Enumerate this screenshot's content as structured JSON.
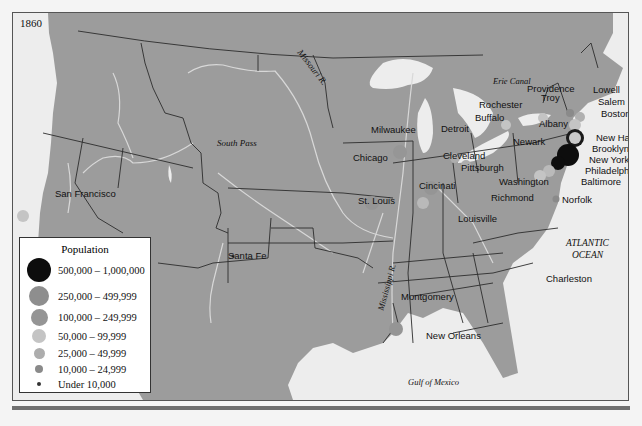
{
  "map": {
    "year": "1860",
    "colors": {
      "land": "#9c9c9c",
      "water": "#ededed",
      "border": "#2d2d2d",
      "river": "#d6d6d6"
    },
    "geo_labels": {
      "missouri_river": "Missouri R.",
      "mississippi_river": "Mississippi R.",
      "south_pass": "South Pass",
      "erie_canal": "Erie Canal",
      "atlantic_line1": "ATLANTIC",
      "atlantic_line2": "OCEAN",
      "gulf": "Gulf of Mexico"
    },
    "cities": [
      {
        "name": "San Francisco",
        "category": "50,000 – 99,999"
      },
      {
        "name": "Santa Fe",
        "category": "Under 10,000"
      },
      {
        "name": "Milwaukee",
        "category": "25,000 – 49,999"
      },
      {
        "name": "Chicago",
        "category": "100,000 – 249,999"
      },
      {
        "name": "Detroit",
        "category": "25,000 – 49,999"
      },
      {
        "name": "St. Louis",
        "category": "100,000 – 249,999"
      },
      {
        "name": "Cleveland",
        "category": "25,000 – 49,999"
      },
      {
        "name": "Cincinati",
        "category": "100,000 – 249,999"
      },
      {
        "name": "Pittsburgh",
        "category": "25,000 – 49,999"
      },
      {
        "name": "Louisville",
        "category": "50,000 – 99,999"
      },
      {
        "name": "Rochester",
        "category": "25,000 – 49,999"
      },
      {
        "name": "Buffalo",
        "category": "50,000 – 99,999"
      },
      {
        "name": "Albany",
        "category": "50,000 – 99,999"
      },
      {
        "name": "Troy",
        "category": "25,000 – 49,999"
      },
      {
        "name": "Providence",
        "category": "50,000 – 99,999"
      },
      {
        "name": "Lowell",
        "category": "25,000 – 49,999"
      },
      {
        "name": "Salem",
        "category": "10,000 – 24,999"
      },
      {
        "name": "Boston",
        "category": "100,000 – 249,999"
      },
      {
        "name": "New Haven",
        "category": "25,000 – 49,999"
      },
      {
        "name": "Brooklyn",
        "category": "250,000 – 499,999"
      },
      {
        "name": "New York",
        "category": "500,000 – 1,000,000"
      },
      {
        "name": "Newark",
        "category": "50,000 – 99,999"
      },
      {
        "name": "Philadelphia",
        "category": "500,000 – 1,000,000"
      },
      {
        "name": "Baltimore",
        "category": "100,000 – 249,999"
      },
      {
        "name": "Washington",
        "category": "50,000 – 99,999"
      },
      {
        "name": "Richmond",
        "category": "25,000 – 49,999"
      },
      {
        "name": "Norfolk",
        "category": "10,000 – 24,999"
      },
      {
        "name": "Charleston",
        "category": "25,000 – 49,999"
      },
      {
        "name": "Montgomery",
        "category": "Under 10,000"
      },
      {
        "name": "New Orleans",
        "category": "100,000 – 249,999"
      }
    ]
  },
  "legend": {
    "title": "Population",
    "items": [
      {
        "label": "500,000 – 1,000,000",
        "size": 24,
        "color": "#0d0d0d"
      },
      {
        "label": "250,000 – 499,999",
        "size": 20,
        "color": "#8e8e8e"
      },
      {
        "label": "100,000 – 249,999",
        "size": 17,
        "color": "#959595"
      },
      {
        "label": "50,000 – 99,999",
        "size": 14,
        "color": "#c4c4c4"
      },
      {
        "label": "25,000 – 49,999",
        "size": 11,
        "color": "#adadad"
      },
      {
        "label": "10,000 – 24,999",
        "size": 8,
        "color": "#8a8a8a"
      },
      {
        "label": "Under 10,000",
        "size": 4,
        "color": "#333333"
      }
    ]
  }
}
